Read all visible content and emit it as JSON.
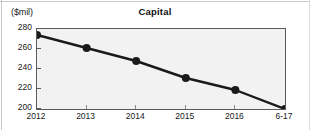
{
  "chart_data": {
    "type": "line",
    "title": "Capital",
    "xlabel": "",
    "ylabel": "($mil)",
    "ylim": [
      200,
      280
    ],
    "ytick_labels": [
      "280",
      "260",
      "240",
      "220",
      "200"
    ],
    "ytick_values": [
      280,
      260,
      240,
      220,
      200
    ],
    "categories": [
      "2012",
      "2013",
      "2014",
      "2015",
      "2016",
      "6-17"
    ],
    "values": [
      274,
      261,
      248,
      231,
      219,
      200
    ],
    "series": [
      {
        "name": "Capital",
        "values": [
          274,
          261,
          248,
          231,
          219,
          200
        ]
      }
    ],
    "grid": false,
    "legend": "none",
    "marker": "filled-circle",
    "line_color": "#1a1a1a",
    "marker_color": "#1a1a1a",
    "plot_background": "#f2f2f2",
    "axis_color": "#5a5a5a"
  }
}
